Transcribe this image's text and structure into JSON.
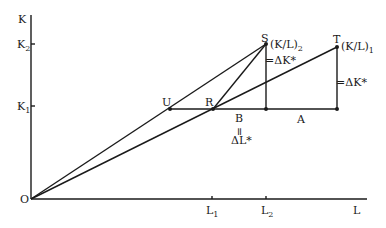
{
  "axes": {
    "y_label": "K",
    "x_label": "L",
    "origin_label": "O",
    "y_ticks": [
      {
        "label": "K",
        "sub": "2",
        "y": 44
      },
      {
        "label": "K",
        "sub": "1",
        "y": 106
      }
    ],
    "x_ticks": [
      {
        "label": "L",
        "sub": "1",
        "x": 212
      },
      {
        "label": "L",
        "sub": "2",
        "x": 266
      }
    ]
  },
  "points": {
    "S": {
      "label": "S",
      "ratio_label": "(K/L)",
      "ratio_sub": "2"
    },
    "T": {
      "label": "T",
      "ratio_label": "(K/L)",
      "ratio_sub": "1"
    },
    "U": {
      "label": "U"
    },
    "R": {
      "label": "R"
    }
  },
  "annotations": {
    "delta_k_s": "=ΔK*",
    "delta_k_t": "=ΔK*",
    "segment_b": "B",
    "equals": "=",
    "delta_l": "ΔL*",
    "segment_a": "A"
  }
}
